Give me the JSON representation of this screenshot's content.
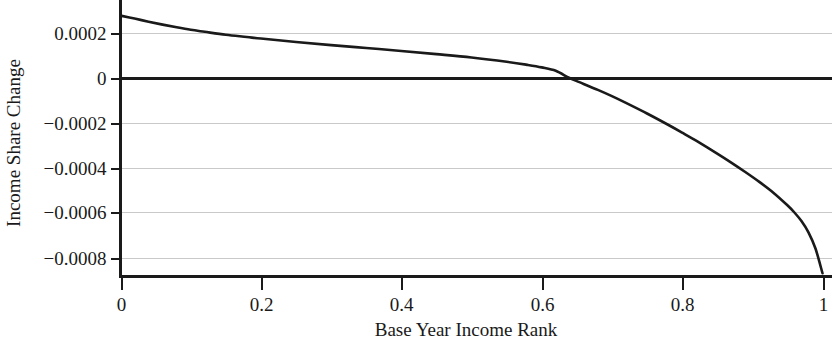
{
  "chart_data": {
    "type": "line",
    "title": "",
    "subtitle": "",
    "xlabel": "Base Year Income Rank",
    "ylabel": "Income Share Change",
    "xlim": [
      0,
      1
    ],
    "ylim": [
      -0.00092,
      0.00031
    ],
    "xticks": [
      0,
      0.2,
      0.4,
      0.6,
      0.8,
      1
    ],
    "xtick_labels": [
      "0",
      "0.2",
      "0.4",
      "0.6",
      "0.8",
      "1"
    ],
    "yticks": [
      0.0002,
      0,
      -0.0002,
      -0.0004,
      -0.0006,
      -0.0008
    ],
    "ytick_labels": [
      "0.0002",
      "0",
      "−0.0002",
      "−0.0004",
      "−0.0006",
      "−0.0008"
    ],
    "grid": true,
    "grid_axis": "y",
    "grid_color": "#c9c9c9",
    "zero_line": true,
    "zero_line_color": "#1a1a1a",
    "legend": null,
    "annotations": [],
    "series": [
      {
        "name": "Income Share Change",
        "color": "#1a1a1a",
        "zero_crossing_x": 0.638,
        "x": [
          0.0,
          0.02,
          0.04,
          0.06,
          0.08,
          0.1,
          0.12,
          0.15,
          0.18,
          0.2,
          0.25,
          0.3,
          0.35,
          0.4,
          0.45,
          0.5,
          0.55,
          0.58,
          0.6,
          0.62,
          0.638,
          0.65,
          0.68,
          0.7,
          0.72,
          0.75,
          0.78,
          0.8,
          0.82,
          0.85,
          0.87,
          0.89,
          0.91,
          0.93,
          0.95,
          0.96,
          0.97,
          0.98,
          0.99,
          1.0
        ],
        "y": [
          0.000275,
          0.000262,
          0.000248,
          0.000235,
          0.000223,
          0.000212,
          0.000203,
          0.00019,
          0.00018,
          0.000173,
          0.000158,
          0.000144,
          0.000131,
          0.000118,
          0.000104,
          8.9e-05,
          7e-05,
          5.6e-05,
          4.5e-05,
          3e-05,
          0.0,
          -1.6e-05,
          -5.5e-05,
          -8.3e-05,
          -0.000113,
          -0.00016,
          -0.00021,
          -0.000245,
          -0.000281,
          -0.000338,
          -0.000378,
          -0.00042,
          -0.000464,
          -0.000512,
          -0.000568,
          -0.0006,
          -0.000638,
          -0.000688,
          -0.00076,
          -0.00087
        ]
      }
    ]
  },
  "figure": {
    "background_color": "#ffffff",
    "axis_color": "#1a1a1a"
  }
}
